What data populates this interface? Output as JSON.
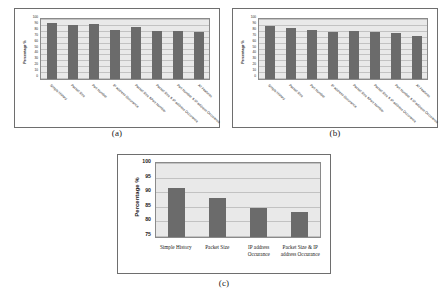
{
  "figure": {
    "panels": [
      {
        "id": "a",
        "caption": "(a)",
        "ylabel": "Percentage %",
        "yticks": [
          "100",
          "90",
          "80",
          "70",
          "60",
          "50",
          "40",
          "30",
          "20",
          "10",
          "0"
        ],
        "ymin": 0,
        "ymax": 100,
        "categories": [
          "Simple History",
          "Packet Size",
          "Port Number",
          "IP address Occurance",
          "Packet Size &Port Number",
          "Packet Size & IP address Occurance",
          "Port Number & IP address Occurance",
          "All Features"
        ],
        "values": [
          93,
          90,
          92,
          81,
          87,
          80,
          80,
          78
        ]
      },
      {
        "id": "b",
        "caption": "(b)",
        "ylabel": "Percentage %",
        "yticks": [
          "100",
          "90",
          "80",
          "70",
          "60",
          "50",
          "40",
          "30",
          "20",
          "10",
          "0"
        ],
        "ymin": 0,
        "ymax": 100,
        "categories": [
          "Simple History",
          "Packet Size",
          "Port Number",
          "IP address Occurance",
          "Packet Size &Port Number",
          "Packet Size & IP address Occurance",
          "Port Number & IP address Occurance",
          "All Features"
        ],
        "values": [
          89,
          85,
          81,
          79,
          80,
          79,
          77,
          72
        ]
      },
      {
        "id": "c",
        "caption": "(c)",
        "ylabel": "Percentage %",
        "yticks": [
          "100",
          "95",
          "90",
          "85",
          "80",
          "75"
        ],
        "ymin": 75,
        "ymax": 100,
        "categories": [
          "Simple History",
          "Packet Size",
          "IP address Occurance",
          "Packet Size & IP address Occurance"
        ],
        "values": [
          91.7,
          88.2,
          84.8,
          83.4
        ]
      }
    ],
    "colors": {
      "bar": "#6b6b6b",
      "plot_background": "#e9e9e9",
      "gridline": "#c2c2c2",
      "border": "#6e6e6e"
    }
  },
  "chart_data": [
    {
      "type": "bar",
      "title": "(a)",
      "xlabel": "",
      "ylabel": "Percentage %",
      "ylim": [
        0,
        100
      ],
      "grid": true,
      "legend": "none",
      "categories": [
        "Simple History",
        "Packet Size",
        "Port Number",
        "IP address Occurance",
        "Packet Size &Port Number",
        "Packet Size & IP address Occurance",
        "Port Number & IP address Occurance",
        "All Features"
      ],
      "values": [
        93,
        90,
        92,
        81,
        87,
        80,
        80,
        78
      ],
      "tick_labels": [
        "0",
        "10",
        "20",
        "30",
        "40",
        "50",
        "60",
        "70",
        "80",
        "90",
        "100"
      ]
    },
    {
      "type": "bar",
      "title": "(b)",
      "xlabel": "",
      "ylabel": "Percentage %",
      "ylim": [
        0,
        100
      ],
      "grid": true,
      "legend": "none",
      "categories": [
        "Simple History",
        "Packet Size",
        "Port Number",
        "IP address Occurance",
        "Packet Size &Port Number",
        "Packet Size & IP address Occurance",
        "Port Number & IP address Occurance",
        "All Features"
      ],
      "values": [
        89,
        85,
        81,
        79,
        80,
        79,
        77,
        72
      ],
      "tick_labels": [
        "0",
        "10",
        "20",
        "30",
        "40",
        "50",
        "60",
        "70",
        "80",
        "90",
        "100"
      ]
    },
    {
      "type": "bar",
      "title": "(c)",
      "xlabel": "",
      "ylabel": "Percentage %",
      "ylim": [
        75,
        100
      ],
      "grid": true,
      "legend": "none",
      "categories": [
        "Simple History",
        "Packet Size",
        "IP address Occurance",
        "Packet Size & IP address Occurance"
      ],
      "values": [
        91.7,
        88.2,
        84.8,
        83.4
      ],
      "tick_labels": [
        "75",
        "80",
        "85",
        "90",
        "95",
        "100"
      ]
    }
  ]
}
